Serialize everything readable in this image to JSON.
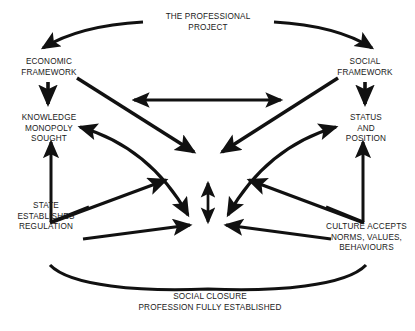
{
  "diagram": {
    "title": "The Professional Project",
    "background_color": "#ffffff",
    "ink_color": "#111111",
    "text_color": "#1a1a1a",
    "nodes": {
      "professional_project": "THE PROFESSIONAL\nPROJECT",
      "economic_framework": "ECONOMIC\nFRAMEWORK",
      "social_framework": "SOCIAL\nFRAMEWORK",
      "knowledge_monopoly": "KNOWLEDGE\nMONOPOLY\nSOUGHT",
      "status_position": "STATUS\nAND\nPOSITION",
      "state_regulation": "STATE\nESTABLISHES\nREGULATION",
      "culture_accepts": "CULTURE ACCEPTS\nNORMS, VALUES,\nBEHAVIOURS",
      "social_closure": "SOCIAL CLOSURE\nPROFESSION FULLY ESTABLISHED"
    },
    "connections": [
      {
        "name": "professional-project-to-economic-framework",
        "from": "professional_project",
        "to": "economic_framework",
        "style": "curved",
        "heads": "single"
      },
      {
        "name": "professional-project-to-social-framework",
        "from": "professional_project",
        "to": "social_framework",
        "style": "curved",
        "heads": "single"
      },
      {
        "name": "economic-framework-to-knowledge-monopoly",
        "from": "economic_framework",
        "to": "knowledge_monopoly",
        "style": "straight",
        "heads": "single"
      },
      {
        "name": "social-framework-to-status-position",
        "from": "social_framework",
        "to": "status_position",
        "style": "straight",
        "heads": "single"
      },
      {
        "name": "economic-framework-to-social-framework",
        "from": "economic_framework",
        "to": "social_framework",
        "style": "straight",
        "heads": "double"
      },
      {
        "name": "economic-framework-to-centre",
        "from": "economic_framework",
        "to": "centre",
        "style": "straight",
        "heads": "single"
      },
      {
        "name": "social-framework-to-centre",
        "from": "social_framework",
        "to": "centre",
        "style": "straight",
        "heads": "single"
      },
      {
        "name": "centre-vertical-exchange",
        "from": "centre_upper",
        "to": "centre_lower",
        "style": "straight",
        "heads": "double"
      },
      {
        "name": "state-regulation-to-knowledge-monopoly",
        "from": "state_regulation",
        "to": "knowledge_monopoly",
        "style": "elbow",
        "heads": "single"
      },
      {
        "name": "culture-accepts-to-status-position",
        "from": "culture_accepts",
        "to": "status_position",
        "style": "elbow",
        "heads": "single"
      },
      {
        "name": "knowledge-monopoly-to-centre-lower-left",
        "from": "knowledge_monopoly",
        "to": "centre_lower_left",
        "style": "curved",
        "heads": "double"
      },
      {
        "name": "status-position-to-centre-lower-right",
        "from": "status_position",
        "to": "centre_lower_right",
        "style": "curved",
        "heads": "double"
      },
      {
        "name": "state-regulation-to-centre-mid-left",
        "from": "state_regulation",
        "to": "centre_mid_left",
        "style": "straight",
        "heads": "single"
      },
      {
        "name": "culture-accepts-to-centre-mid-right",
        "from": "culture_accepts",
        "to": "centre_mid_right",
        "style": "straight",
        "heads": "single"
      },
      {
        "name": "state-regulation-to-centre-base",
        "from": "state_regulation",
        "to": "centre_base",
        "style": "straight",
        "heads": "single"
      },
      {
        "name": "culture-accepts-to-centre-base",
        "from": "culture_accepts",
        "to": "centre_base",
        "style": "straight",
        "heads": "single"
      },
      {
        "name": "social-closure-bracket",
        "from": "state_regulation",
        "to": "culture_accepts",
        "style": "curved-v",
        "heads": "none"
      }
    ]
  }
}
